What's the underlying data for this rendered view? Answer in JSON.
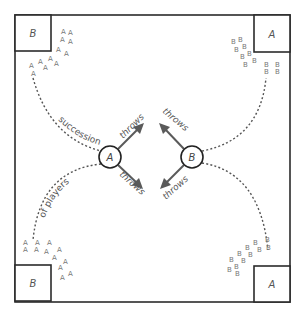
{
  "diagram": {
    "title": "",
    "field": {
      "x": 15,
      "y": 15,
      "width": 275,
      "height": 287
    },
    "corners": [
      {
        "id": "top-left",
        "label": "B",
        "x": 15,
        "y": 15,
        "size": 36
      },
      {
        "id": "top-right",
        "label": "A",
        "x": 254,
        "y": 15,
        "size": 37
      },
      {
        "id": "bottom-left",
        "label": "B",
        "x": 15,
        "y": 265,
        "size": 36
      },
      {
        "id": "bottom-right",
        "label": "A",
        "x": 254,
        "y": 266,
        "size": 36
      }
    ],
    "throwers": [
      {
        "id": "thrower-a",
        "label": "A",
        "cx": 110,
        "cy": 157,
        "r": 11
      },
      {
        "id": "thrower-b",
        "label": "B",
        "cx": 192,
        "cy": 157,
        "r": 11
      }
    ],
    "path_labels": {
      "top": "succession",
      "bottom": "of players"
    },
    "throw_label": "throws",
    "player_glyphs": {
      "top_left": "A",
      "top_right": "B",
      "bottom_left": "A",
      "bottom_right": "B"
    },
    "colors": {
      "stroke": "#2b2b2b",
      "arrow": "#5a5a5a",
      "text": "#555555",
      "background": "#ffffff"
    }
  }
}
